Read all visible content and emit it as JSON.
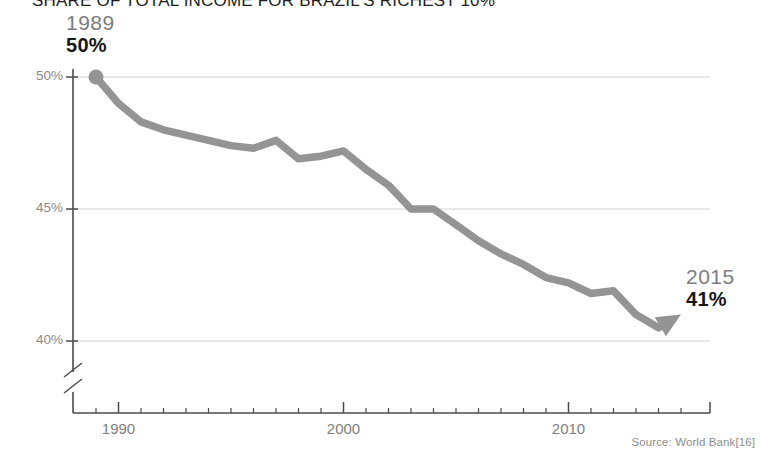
{
  "title": "SHARE OF TOTAL INCOME FOR BRAZIL'S RICHEST 10%",
  "source": "Source: World Bank[16]",
  "callout_start": {
    "year": "1989",
    "value": "50%"
  },
  "callout_end": {
    "year": "2015",
    "value": "41%"
  },
  "axis": {
    "y_ticks": [
      "50%",
      "45%",
      "40%"
    ],
    "x_ticks": [
      "1990",
      "2000",
      "2010"
    ]
  },
  "colors": {
    "line": "#949494",
    "grid": "#d2d2d2",
    "axis": "#4a4a4a",
    "tick_label": "#8a8a8a",
    "title": "#1d1d1d",
    "value_text": "#161616",
    "year_text": "#7d7d7d"
  },
  "chart_data": {
    "type": "line",
    "title": "SHARE OF TOTAL INCOME FOR BRAZIL'S RICHEST 10%",
    "xlabel": "",
    "ylabel": "",
    "ylim": [
      39.5,
      50.5
    ],
    "xlim": [
      1989,
      2015
    ],
    "grid": true,
    "legend": null,
    "y_tick_values": [
      50,
      45,
      40
    ],
    "y_tick_labels": [
      "50%",
      "45%",
      "40%"
    ],
    "x_tick_values": [
      1990,
      2000,
      2010
    ],
    "x_tick_labels": [
      "1990",
      "2000",
      "2010"
    ],
    "axis_break_y": true,
    "annotations": [
      {
        "text": "1989 50%",
        "x": 1989,
        "y": 50,
        "marker": "dot"
      },
      {
        "text": "2015 41%",
        "x": 2015,
        "y": 41,
        "marker": "arrow"
      }
    ],
    "x": [
      1989,
      1990,
      1991,
      1992,
      1993,
      1994,
      1995,
      1996,
      1997,
      1998,
      1999,
      2000,
      2001,
      2002,
      2003,
      2004,
      2005,
      2006,
      2007,
      2008,
      2009,
      2010,
      2011,
      2012,
      2013,
      2014,
      2015
    ],
    "values": [
      50.0,
      49.0,
      48.3,
      48.0,
      47.8,
      47.6,
      47.4,
      47.3,
      47.6,
      46.9,
      47.0,
      47.2,
      46.5,
      45.9,
      45.0,
      45.0,
      44.4,
      43.8,
      43.3,
      42.9,
      42.4,
      42.2,
      41.8,
      41.9,
      41.0,
      40.5,
      41.0
    ],
    "series": [
      {
        "name": "Income share of richest 10%",
        "values": [
          50.0,
          49.0,
          48.3,
          48.0,
          47.8,
          47.6,
          47.4,
          47.3,
          47.6,
          46.9,
          47.0,
          47.2,
          46.5,
          45.9,
          45.0,
          45.0,
          44.4,
          43.8,
          43.3,
          42.9,
          42.4,
          42.2,
          41.8,
          41.9,
          41.0,
          40.5,
          41.0
        ]
      }
    ]
  }
}
